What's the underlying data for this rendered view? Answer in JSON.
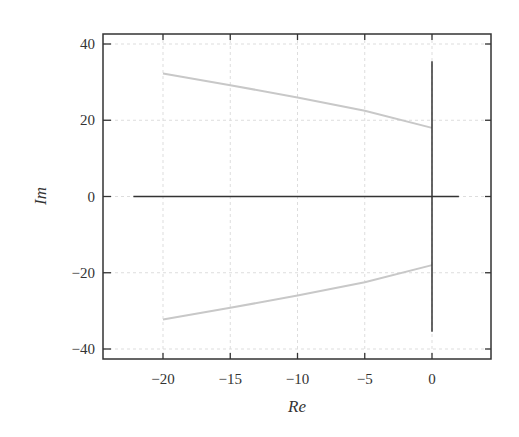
{
  "chart_data": {
    "type": "line",
    "title": "",
    "xlabel": "Re",
    "ylabel": "Im",
    "xlim": [
      -24.5,
      4.5
    ],
    "ylim": [
      -42.5,
      42
    ],
    "xticks": [
      -20,
      -15,
      -10,
      -5,
      0
    ],
    "yticks": [
      -40,
      -20,
      0,
      20,
      40
    ],
    "xtick_labels": [
      "−20",
      "−15",
      "−10",
      "−5",
      "0"
    ],
    "ytick_labels": [
      "−40",
      "−20",
      "0",
      "20",
      "40"
    ],
    "grid": true,
    "legend": null,
    "series": [
      {
        "name": "upper branch",
        "color": "#c8c8c8",
        "points": [
          [
            -20,
            32.3
          ],
          [
            -15,
            29.2
          ],
          [
            -10,
            26.0
          ],
          [
            -5,
            22.5
          ],
          [
            0,
            18.0
          ]
        ]
      },
      {
        "name": "lower branch",
        "color": "#c8c8c8",
        "points": [
          [
            -20,
            -32.3
          ],
          [
            -15,
            -29.2
          ],
          [
            -10,
            -26.0
          ],
          [
            -5,
            -22.5
          ],
          [
            0,
            -18.0
          ]
        ]
      },
      {
        "name": "real axis",
        "color": "#333333",
        "points": [
          [
            -22.2,
            0
          ],
          [
            2.0,
            0
          ]
        ]
      },
      {
        "name": "imaginary axis",
        "color": "#333333",
        "points": [
          [
            0,
            35.5
          ],
          [
            0,
            -35.5
          ]
        ]
      }
    ]
  }
}
